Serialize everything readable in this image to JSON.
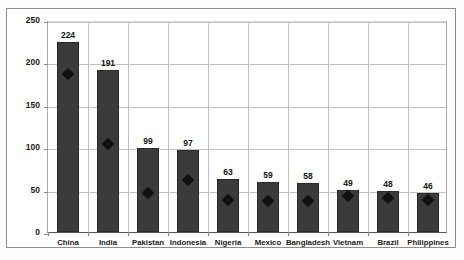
{
  "chart_data": {
    "type": "bar",
    "title": "",
    "xlabel": "",
    "ylabel": "Unbanked Adults (Millions)",
    "ylim": [
      0,
      250
    ],
    "yticks": [
      0,
      50,
      100,
      150,
      200,
      250
    ],
    "grid": true,
    "legend_position": "none",
    "categories": [
      "China",
      "India",
      "Pakistan",
      "Indonesia",
      "Nigeria",
      "Mexico",
      "Bangladesh",
      "Vietnam",
      "Brazil",
      "Philippines"
    ],
    "series": [
      {
        "name": "Unbanked Adults (Millions)",
        "type": "bar",
        "values": [
          224,
          191,
          99,
          97,
          63,
          59,
          58,
          49,
          48,
          46
        ],
        "labels": [
          "224",
          "191",
          "99",
          "97",
          "63",
          "59",
          "58",
          "49",
          "48",
          "46"
        ],
        "color": "#3b3b3b"
      },
      {
        "name": "Marker series",
        "type": "scatter",
        "values": [
          186,
          104,
          46,
          61,
          38,
          36,
          36,
          42,
          40,
          38
        ],
        "color": "#111111",
        "marker": "diamond"
      }
    ]
  }
}
